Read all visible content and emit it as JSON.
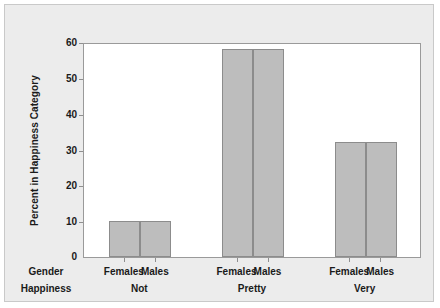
{
  "chart_data": {
    "type": "bar",
    "title": "",
    "xlabel": "",
    "ylabel": "Percent in Happiness Category",
    "ylim": [
      0,
      60
    ],
    "yticks": [
      0,
      10,
      20,
      30,
      40,
      50,
      60
    ],
    "grid": false,
    "legend": null,
    "axis_rows": [
      {
        "name": "Gender"
      },
      {
        "name": "Happiness"
      }
    ],
    "categories": [
      "Not",
      "Pretty",
      "Very"
    ],
    "subcategories": [
      "Females",
      "Males"
    ],
    "series": [
      {
        "name": "Females",
        "values": [
          10,
          58,
          32
        ]
      },
      {
        "name": "Males",
        "values": [
          10,
          58,
          32
        ]
      }
    ],
    "groups": [
      {
        "happiness": "Not",
        "bars": [
          {
            "gender": "Females",
            "value": 10
          },
          {
            "gender": "Males",
            "value": 10
          }
        ]
      },
      {
        "happiness": "Pretty",
        "bars": [
          {
            "gender": "Females",
            "value": 58
          },
          {
            "gender": "Males",
            "value": 58
          }
        ]
      },
      {
        "happiness": "Very",
        "bars": [
          {
            "gender": "Females",
            "value": 32
          },
          {
            "gender": "Males",
            "value": 32
          }
        ]
      }
    ],
    "colors": {
      "bar_fill": "#bdbdbd",
      "bar_edge": "#8c8c8c",
      "plot_background": "#ffffff",
      "figure_background": "#ececec",
      "text": "#1a1a1a"
    }
  }
}
